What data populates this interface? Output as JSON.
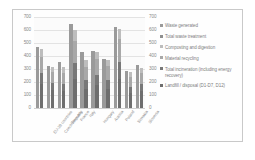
{
  "chart_data": {
    "type": "bar",
    "title": "",
    "subtitle": "",
    "xlabel": "",
    "ylabel": "",
    "ylim": [
      0,
      700
    ],
    "yticks": [
      0,
      100,
      200,
      300,
      400,
      500,
      600,
      700
    ],
    "ytick_labels": [
      "0",
      "100",
      "200",
      "300",
      "400",
      "500",
      "600",
      "700"
    ],
    "secondary_axis": {
      "ylim": [
        0,
        700
      ],
      "yticks": [
        0,
        100,
        200,
        300,
        400,
        500,
        600,
        700
      ],
      "ytick_labels": [
        "0",
        "100",
        "200",
        "300",
        "400",
        "500",
        "600",
        "700"
      ]
    },
    "grid": true,
    "legend_position": "right",
    "stacked": true,
    "categories": [
      "EU-28 countries",
      "Czech Republic",
      "Germany",
      "France",
      "Italy",
      "Hungary",
      "Austria",
      "Poland",
      "Slovakia",
      "Slovenia"
    ],
    "series": [
      {
        "name": "Waste generated",
        "color": "#9a9a9a",
        "values": [
          470,
          323,
          355,
          645,
          432,
          440,
          375,
          625,
          282,
          330
        ]
      },
      {
        "name": "Total waste treatment",
        "color": "#8f8f8f",
        "values": [
          455,
          318,
          312,
          598,
          368,
          428,
          372,
          608,
          276,
          308
        ]
      },
      {
        "name": "Composting and digestion",
        "color": "#bdbdbd",
        "values": [
          80,
          55,
          62,
          95,
          70,
          58,
          66,
          88,
          44,
          52
        ]
      },
      {
        "name": "Material recycling",
        "color": "#a8a8a8",
        "values": [
          165,
          120,
          118,
          205,
          140,
          150,
          135,
          210,
          98,
          112
        ]
      },
      {
        "name": "Total incineration (including energy recovery)",
        "color": "#787878",
        "values": [
          115,
          72,
          78,
          145,
          88,
          96,
          84,
          150,
          60,
          70
        ]
      },
      {
        "name": "Landfill / disposal (D1-D7, D12)",
        "color": "#6e6e6e",
        "values": [
          240,
          185,
          180,
          260,
          200,
          212,
          190,
          265,
          150,
          178
        ]
      }
    ]
  },
  "legend": {
    "items": [
      "Waste generated",
      "Total waste treatment",
      "Composting and digestion",
      "Material recycling",
      "Total incineration (including energy recovery)",
      "Landfill / disposal (D1-D7, D12)"
    ]
  }
}
